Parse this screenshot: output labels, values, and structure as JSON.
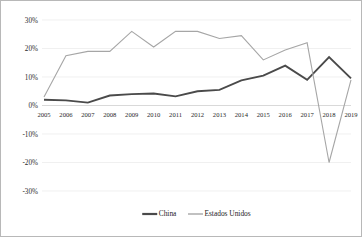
{
  "chart_data": {
    "type": "line",
    "title": "",
    "subtitle": "",
    "xlabel": "",
    "ylabel": "",
    "grid": true,
    "legend_position": "bottom-center",
    "ylim": [
      -30,
      30
    ],
    "ytick_labels": [
      "30%",
      "20%",
      "10%",
      "0%",
      "-10%",
      "-20%",
      "-30%"
    ],
    "ytick_values": [
      30,
      20,
      10,
      0,
      -10,
      -20,
      -30
    ],
    "categories": [
      "2005",
      "2006",
      "2007",
      "2008",
      "2009",
      "2010",
      "2011",
      "2012",
      "2013",
      "2014",
      "2015",
      "2016",
      "2017",
      "2018",
      "2019"
    ],
    "series": [
      {
        "name": "China",
        "color": "#4a4a4a",
        "stroke_width": 1.9,
        "values": [
          2.0,
          1.8,
          1.0,
          3.5,
          4.0,
          4.2,
          3.2,
          5.0,
          5.5,
          8.8,
          10.5,
          14.0,
          9.0,
          17.0,
          9.5
        ]
      },
      {
        "name": "Estados Unidos",
        "color": "#a6a6a6",
        "stroke_width": 1.1,
        "values": [
          3.0,
          17.5,
          19.0,
          19.0,
          26.0,
          20.5,
          26.0,
          26.0,
          23.5,
          24.5,
          16.0,
          19.5,
          22.0,
          -20.0,
          9.0
        ]
      }
    ]
  },
  "legend": {
    "items": [
      {
        "label": "China"
      },
      {
        "label": "Estados Unidos"
      }
    ]
  },
  "colors": {
    "china": "#4a4a4a",
    "estados_unidos": "#a6a6a6",
    "gridline": "#e9e9e9",
    "border": "#b8b8b8",
    "text": "#2a2a2a",
    "background": "#ffffff"
  }
}
